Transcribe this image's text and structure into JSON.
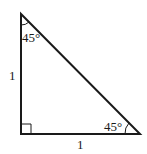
{
  "diagram": {
    "type": "right-isosceles-triangle",
    "vertices": {
      "top": [
        21,
        14
      ],
      "bottom_left": [
        21,
        134
      ],
      "bottom_right": [
        140,
        134
      ]
    },
    "labels": {
      "left_side": "1",
      "bottom_side": "1",
      "top_angle": "45°",
      "bottom_right_angle": "45°"
    },
    "right_angle_marker": true,
    "stroke_color": "#1a1a1a"
  }
}
